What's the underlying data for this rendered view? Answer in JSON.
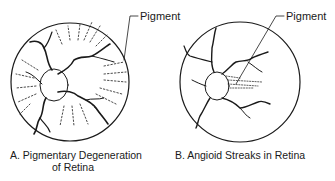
{
  "figure": {
    "panels": [
      {
        "id": "A",
        "caption_line1": "A. Pigmentary Degeneration",
        "caption_line2": "of Retina",
        "callout": "Pigment"
      },
      {
        "id": "B",
        "caption": "B. Angioid Streaks in Retina",
        "callout": "Pigment"
      }
    ],
    "colors": {
      "ink": "#1a1a1a",
      "background": "#ffffff"
    }
  }
}
